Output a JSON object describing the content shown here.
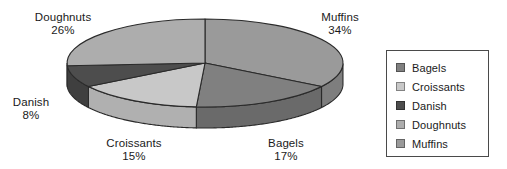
{
  "chart_data": {
    "type": "pie",
    "title": "",
    "style": "3d-pie",
    "categories": [
      "Bagels",
      "Croissants",
      "Danish",
      "Doughnuts",
      "Muffins"
    ],
    "values": [
      17,
      15,
      8,
      26,
      34
    ],
    "value_unit": "%",
    "legend_position": "right",
    "grid": false,
    "slices": [
      {
        "name": "Muffins",
        "percent": 34,
        "label": "Muffins",
        "percent_label": "34%",
        "color": "#9a9a9a",
        "side_color": "#7e7e7e"
      },
      {
        "name": "Bagels",
        "percent": 17,
        "label": "Bagels",
        "percent_label": "17%",
        "color": "#808080",
        "side_color": "#6a6a6a"
      },
      {
        "name": "Croissants",
        "percent": 15,
        "label": "Croissants",
        "percent_label": "15%",
        "color": "#c8c8c8",
        "side_color": "#b0b0b0"
      },
      {
        "name": "Danish",
        "percent": 8,
        "label": "Danish",
        "percent_label": "8%",
        "color": "#4d4d4d",
        "side_color": "#3f3f3f"
      },
      {
        "name": "Doughnuts",
        "percent": 26,
        "label": "Doughnuts",
        "percent_label": "26%",
        "color": "#adadad",
        "side_color": "#919191"
      }
    ]
  },
  "labels": {
    "doughnuts": {
      "name": "Doughnuts",
      "percent": "26%"
    },
    "muffins": {
      "name": "Muffins",
      "percent": "34%"
    },
    "danish": {
      "name": "Danish",
      "percent": "8%"
    },
    "croissants": {
      "name": "Croissants",
      "percent": "15%"
    },
    "bagels": {
      "name": "Bagels",
      "percent": "17%"
    }
  },
  "legend": {
    "items": [
      {
        "label": "Bagels",
        "color": "#808080"
      },
      {
        "label": "Croissants",
        "color": "#c8c8c8"
      },
      {
        "label": "Danish",
        "color": "#4d4d4d"
      },
      {
        "label": "Doughnuts",
        "color": "#adadad"
      },
      {
        "label": "Muffins",
        "color": "#9a9a9a"
      }
    ]
  },
  "colors": {
    "outline": "#2a2a2a",
    "legend_border": "#4a4a4a",
    "text": "#1a1a1a",
    "background": "#ffffff"
  }
}
